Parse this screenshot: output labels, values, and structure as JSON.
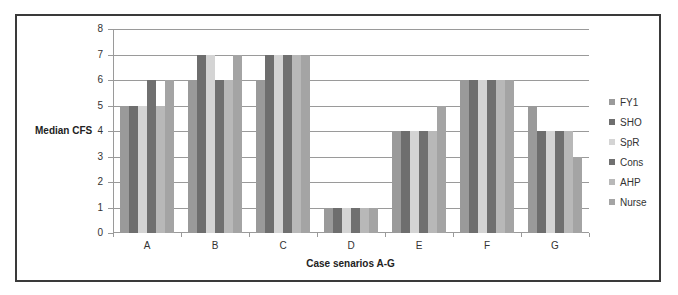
{
  "chart_data": {
    "type": "bar",
    "title": "",
    "xlabel": "Case senarios A-G",
    "ylabel": "Median CFS",
    "ylim": [
      0,
      8
    ],
    "yticks": [
      0,
      1,
      2,
      3,
      4,
      5,
      6,
      7,
      8
    ],
    "grid": true,
    "legend_position": "right",
    "categories": [
      "A",
      "B",
      "C",
      "D",
      "E",
      "F",
      "G"
    ],
    "series": [
      {
        "name": "FY1",
        "color": "#9a9a9a",
        "values": [
          5,
          6,
          6,
          1,
          4,
          6,
          5
        ]
      },
      {
        "name": "SHO",
        "color": "#6e6e6e",
        "values": [
          5,
          7,
          7,
          1,
          4,
          6,
          4
        ]
      },
      {
        "name": "SpR",
        "color": "#d4d4d4",
        "values": [
          5,
          7,
          7,
          1,
          4,
          6,
          4
        ]
      },
      {
        "name": "Cons",
        "color": "#707070",
        "values": [
          6,
          6,
          7,
          1,
          4,
          6,
          4
        ]
      },
      {
        "name": "AHP",
        "color": "#b8b8b8",
        "values": [
          5,
          6,
          7,
          1,
          4,
          6,
          4
        ]
      },
      {
        "name": "Nurse",
        "color": "#a4a4a4",
        "values": [
          6,
          7,
          7,
          1,
          5,
          6,
          3
        ]
      }
    ]
  }
}
